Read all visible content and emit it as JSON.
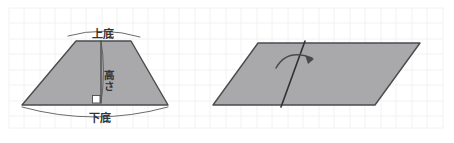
{
  "figure": {
    "background_color": "#ffffff",
    "grid_color": "#f2f2f4",
    "shape_fill_color": "#a9a9ab",
    "shape_outline_color": "#4b4b4d",
    "ink_color": "#4a4a4d"
  },
  "trapezoid": {
    "name": "trapezoid",
    "labels": {
      "top_base": "上底",
      "height": "高さ",
      "bottom_base": "下底"
    },
    "right_angle_marker": "right-angle"
  },
  "parallelogram": {
    "name": "parallelogram",
    "fold_line": "diagonal-fold-line",
    "rotation_arrow": "curved-rotation-arrow"
  }
}
